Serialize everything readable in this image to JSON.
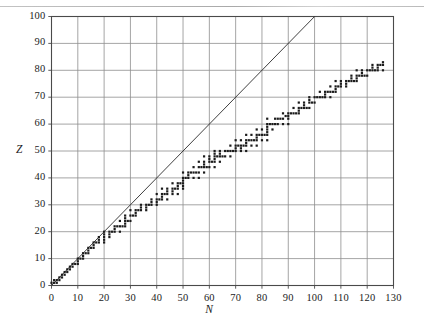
{
  "figure": {
    "kind": "scatter-plot",
    "background_color": "#ffffff",
    "ink_color": "#1b1b1b",
    "grid_color": "#8e8e8e",
    "frame_color": "#4a4a4a"
  },
  "axes": {
    "x_title": "N",
    "y_title": "Z",
    "x_ticks": [
      "0",
      "10",
      "20",
      "30",
      "40",
      "50",
      "60",
      "70",
      "80",
      "90",
      "100",
      "110",
      "120",
      "130"
    ],
    "y_ticks": [
      "0",
      "10",
      "20",
      "30",
      "40",
      "50",
      "60",
      "70",
      "80",
      "90",
      "100"
    ]
  },
  "chart_data": {
    "type": "scatter",
    "title": "",
    "subtitle": "",
    "xlabel": "N",
    "ylabel": "Z",
    "xlim": [
      0,
      130
    ],
    "ylim": [
      0,
      100
    ],
    "x_tick_step": 10,
    "y_tick_step": 10,
    "grid": true,
    "legend": null,
    "annotations": [],
    "series": [
      {
        "name": "stable nuclides",
        "marker": "square",
        "marker_size_px": 2.2,
        "color": "#1b1b1b",
        "points": [
          [
            0,
            1
          ],
          [
            1,
            1
          ],
          [
            2,
            2
          ],
          [
            1,
            2
          ],
          [
            2,
            1
          ],
          [
            3,
            2
          ],
          [
            4,
            3
          ],
          [
            3,
            3
          ],
          [
            4,
            4
          ],
          [
            5,
            4
          ],
          [
            6,
            5
          ],
          [
            5,
            5
          ],
          [
            6,
            6
          ],
          [
            7,
            6
          ],
          [
            7,
            7
          ],
          [
            8,
            7
          ],
          [
            8,
            8
          ],
          [
            9,
            8
          ],
          [
            10,
            8
          ],
          [
            10,
            9
          ],
          [
            10,
            10
          ],
          [
            11,
            10
          ],
          [
            12,
            10
          ],
          [
            12,
            11
          ],
          [
            12,
            12
          ],
          [
            13,
            12
          ],
          [
            14,
            12
          ],
          [
            14,
            13
          ],
          [
            14,
            14
          ],
          [
            15,
            14
          ],
          [
            16,
            14
          ],
          [
            16,
            15
          ],
          [
            16,
            16
          ],
          [
            17,
            16
          ],
          [
            18,
            16
          ],
          [
            20,
            16
          ],
          [
            18,
            17
          ],
          [
            20,
            17
          ],
          [
            18,
            18
          ],
          [
            20,
            18
          ],
          [
            22,
            18
          ],
          [
            20,
            19
          ],
          [
            22,
            19
          ],
          [
            20,
            20
          ],
          [
            22,
            20
          ],
          [
            23,
            20
          ],
          [
            24,
            20
          ],
          [
            26,
            20
          ],
          [
            24,
            21
          ],
          [
            24,
            22
          ],
          [
            25,
            22
          ],
          [
            26,
            22
          ],
          [
            27,
            22
          ],
          [
            28,
            22
          ],
          [
            28,
            23
          ],
          [
            28,
            24
          ],
          [
            29,
            24
          ],
          [
            26,
            24
          ],
          [
            30,
            24
          ],
          [
            28,
            25
          ],
          [
            28,
            26
          ],
          [
            30,
            26
          ],
          [
            31,
            26
          ],
          [
            32,
            26
          ],
          [
            32,
            27
          ],
          [
            30,
            28
          ],
          [
            32,
            28
          ],
          [
            33,
            28
          ],
          [
            34,
            28
          ],
          [
            36,
            28
          ],
          [
            34,
            29
          ],
          [
            36,
            29
          ],
          [
            34,
            30
          ],
          [
            36,
            30
          ],
          [
            37,
            30
          ],
          [
            38,
            30
          ],
          [
            40,
            30
          ],
          [
            38,
            31
          ],
          [
            40,
            31
          ],
          [
            38,
            32
          ],
          [
            40,
            32
          ],
          [
            41,
            32
          ],
          [
            42,
            32
          ],
          [
            44,
            32
          ],
          [
            42,
            33
          ],
          [
            40,
            34
          ],
          [
            42,
            34
          ],
          [
            43,
            34
          ],
          [
            44,
            34
          ],
          [
            46,
            34
          ],
          [
            48,
            34
          ],
          [
            44,
            35
          ],
          [
            46,
            35
          ],
          [
            42,
            36
          ],
          [
            44,
            36
          ],
          [
            46,
            36
          ],
          [
            47,
            36
          ],
          [
            48,
            36
          ],
          [
            50,
            36
          ],
          [
            48,
            37
          ],
          [
            50,
            37
          ],
          [
            46,
            38
          ],
          [
            48,
            38
          ],
          [
            49,
            38
          ],
          [
            50,
            38
          ],
          [
            50,
            39
          ],
          [
            50,
            40
          ],
          [
            51,
            40
          ],
          [
            52,
            40
          ],
          [
            54,
            40
          ],
          [
            56,
            40
          ],
          [
            52,
            41
          ],
          [
            50,
            42
          ],
          [
            52,
            42
          ],
          [
            53,
            42
          ],
          [
            54,
            42
          ],
          [
            55,
            42
          ],
          [
            56,
            42
          ],
          [
            58,
            42
          ],
          [
            54,
            44
          ],
          [
            56,
            44
          ],
          [
            57,
            44
          ],
          [
            58,
            44
          ],
          [
            59,
            44
          ],
          [
            60,
            44
          ],
          [
            62,
            44
          ],
          [
            58,
            45
          ],
          [
            56,
            46
          ],
          [
            58,
            46
          ],
          [
            60,
            46
          ],
          [
            61,
            46
          ],
          [
            62,
            46
          ],
          [
            64,
            46
          ],
          [
            60,
            47
          ],
          [
            62,
            47
          ],
          [
            58,
            48
          ],
          [
            60,
            48
          ],
          [
            62,
            48
          ],
          [
            63,
            48
          ],
          [
            64,
            48
          ],
          [
            65,
            48
          ],
          [
            66,
            48
          ],
          [
            68,
            48
          ],
          [
            62,
            49
          ],
          [
            64,
            49
          ],
          [
            62,
            50
          ],
          [
            64,
            50
          ],
          [
            66,
            50
          ],
          [
            67,
            50
          ],
          [
            68,
            50
          ],
          [
            69,
            50
          ],
          [
            70,
            50
          ],
          [
            72,
            50
          ],
          [
            74,
            50
          ],
          [
            70,
            51
          ],
          [
            72,
            51
          ],
          [
            68,
            52
          ],
          [
            70,
            52
          ],
          [
            71,
            52
          ],
          [
            72,
            52
          ],
          [
            73,
            52
          ],
          [
            74,
            52
          ],
          [
            76,
            52
          ],
          [
            78,
            52
          ],
          [
            74,
            53
          ],
          [
            70,
            54
          ],
          [
            72,
            54
          ],
          [
            74,
            54
          ],
          [
            75,
            54
          ],
          [
            76,
            54
          ],
          [
            77,
            54
          ],
          [
            78,
            54
          ],
          [
            80,
            54
          ],
          [
            82,
            54
          ],
          [
            78,
            55
          ],
          [
            74,
            56
          ],
          [
            76,
            56
          ],
          [
            78,
            56
          ],
          [
            79,
            56
          ],
          [
            80,
            56
          ],
          [
            81,
            56
          ],
          [
            82,
            56
          ],
          [
            82,
            57
          ],
          [
            82,
            58
          ],
          [
            78,
            58
          ],
          [
            80,
            58
          ],
          [
            84,
            58
          ],
          [
            82,
            59
          ],
          [
            82,
            60
          ],
          [
            83,
            60
          ],
          [
            84,
            60
          ],
          [
            85,
            60
          ],
          [
            86,
            60
          ],
          [
            88,
            60
          ],
          [
            90,
            60
          ],
          [
            82,
            62
          ],
          [
            85,
            62
          ],
          [
            86,
            62
          ],
          [
            87,
            62
          ],
          [
            88,
            62
          ],
          [
            90,
            62
          ],
          [
            89,
            63
          ],
          [
            90,
            63
          ],
          [
            88,
            64
          ],
          [
            90,
            64
          ],
          [
            91,
            64
          ],
          [
            92,
            64
          ],
          [
            93,
            64
          ],
          [
            94,
            64
          ],
          [
            94,
            65
          ],
          [
            92,
            66
          ],
          [
            94,
            66
          ],
          [
            95,
            66
          ],
          [
            96,
            66
          ],
          [
            97,
            66
          ],
          [
            98,
            66
          ],
          [
            96,
            67
          ],
          [
            94,
            68
          ],
          [
            96,
            68
          ],
          [
            98,
            68
          ],
          [
            99,
            68
          ],
          [
            100,
            68
          ],
          [
            98,
            69
          ],
          [
            100,
            70
          ],
          [
            101,
            70
          ],
          [
            102,
            70
          ],
          [
            103,
            70
          ],
          [
            104,
            70
          ],
          [
            106,
            70
          ],
          [
            98,
            70
          ],
          [
            104,
            71
          ],
          [
            104,
            72
          ],
          [
            105,
            72
          ],
          [
            106,
            72
          ],
          [
            107,
            72
          ],
          [
            108,
            72
          ],
          [
            102,
            72
          ],
          [
            108,
            73
          ],
          [
            106,
            74
          ],
          [
            108,
            74
          ],
          [
            109,
            74
          ],
          [
            110,
            74
          ],
          [
            112,
            74
          ],
          [
            110,
            75
          ],
          [
            112,
            75
          ],
          [
            108,
            76
          ],
          [
            110,
            76
          ],
          [
            112,
            76
          ],
          [
            113,
            76
          ],
          [
            114,
            76
          ],
          [
            115,
            76
          ],
          [
            116,
            76
          ],
          [
            114,
            77
          ],
          [
            116,
            77
          ],
          [
            114,
            78
          ],
          [
            116,
            78
          ],
          [
            117,
            78
          ],
          [
            118,
            78
          ],
          [
            119,
            78
          ],
          [
            120,
            78
          ],
          [
            118,
            79
          ],
          [
            120,
            80
          ],
          [
            121,
            80
          ],
          [
            122,
            80
          ],
          [
            123,
            80
          ],
          [
            124,
            80
          ],
          [
            126,
            80
          ],
          [
            116,
            80
          ],
          [
            118,
            80
          ],
          [
            122,
            81
          ],
          [
            124,
            81
          ],
          [
            122,
            82
          ],
          [
            124,
            82
          ],
          [
            125,
            82
          ],
          [
            126,
            82
          ],
          [
            126,
            83
          ]
        ]
      }
    ],
    "reference_line": {
      "name": "N = Z",
      "from": [
        0,
        0
      ],
      "to": [
        100,
        100
      ],
      "color": "#2a2a2a",
      "width_px": 0.9
    }
  }
}
